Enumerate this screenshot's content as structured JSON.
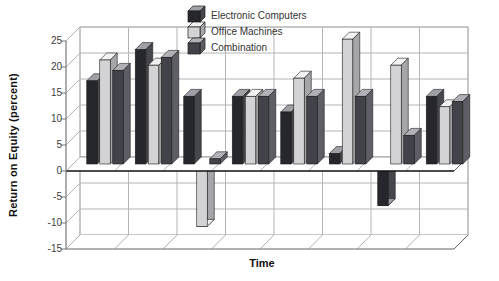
{
  "chart_data": {
    "type": "bar",
    "projection": "3d-oblique-grouped",
    "title": "",
    "xlabel": "Time",
    "ylabel": "Return on Equity (percent)",
    "ylim": [
      -15,
      25
    ],
    "yticks": [
      25,
      20,
      15,
      10,
      5,
      0,
      -5,
      -10,
      -15
    ],
    "ytick_interval": 5,
    "x_tick_labels": [],
    "n_groups": 8,
    "grid": true,
    "legend_position": "top-center",
    "series": [
      {
        "name": "Electronic Computers",
        "color_front": "#26262d",
        "color_top": "#9fa0a6",
        "color_side": "#46464d",
        "values": [
          16,
          22,
          13,
          13,
          10,
          2,
          -8,
          13
        ]
      },
      {
        "name": "Office Machines",
        "color_front": "#d3d3d5",
        "color_top": "#f2f2f3",
        "color_side": "#a6a6aa",
        "values": [
          20,
          19,
          -12,
          13,
          16.5,
          24,
          19,
          11
        ]
      },
      {
        "name": "Combination",
        "color_front": "#42424a",
        "color_top": "#b0b0b6",
        "color_side": "#5e5e66",
        "values": [
          18,
          20.5,
          1,
          13,
          13,
          13,
          5.5,
          12
        ]
      }
    ]
  },
  "colors": {
    "background": "#ffffff",
    "gridline": "#b4b4b4",
    "axis": "#777777",
    "floor_edge": "#666666",
    "zero_line": "#111111",
    "wall_fill": "#ffffff",
    "tick_text": "#3d3d3d",
    "bar_outline": "#1c1c1c"
  }
}
